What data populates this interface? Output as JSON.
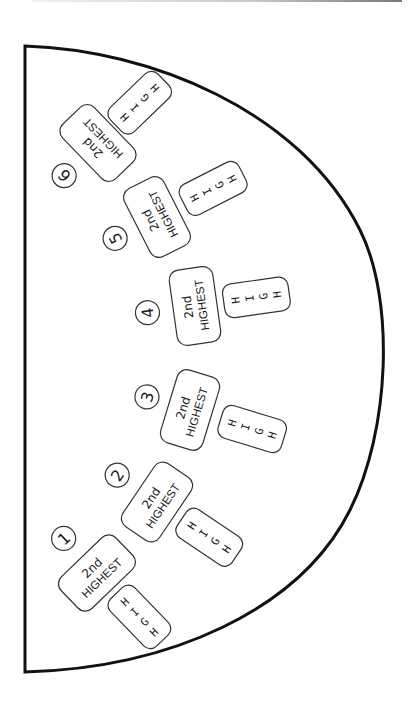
{
  "diagram": {
    "type": "card-table-layout",
    "colors": {
      "outline": "#111111",
      "box_stroke": "#333333",
      "text": "#1a1a1a",
      "background": "#ffffff"
    },
    "seats": [
      {
        "number": "1",
        "line1": "2nd",
        "line2": "HIGHEST",
        "high": [
          "H",
          "I",
          "G",
          "H"
        ]
      },
      {
        "number": "2",
        "line1": "2nd",
        "line2": "HIGHEST",
        "high": [
          "H",
          "I",
          "G",
          "H"
        ]
      },
      {
        "number": "3",
        "line1": "2nd",
        "line2": "HIGHEST",
        "high": [
          "H",
          "I",
          "G",
          "H"
        ]
      },
      {
        "number": "4",
        "line1": "2nd",
        "line2": "HIGHEST",
        "high": [
          "H",
          "I",
          "G",
          "H"
        ]
      },
      {
        "number": "5",
        "line1": "2nd",
        "line2": "HIGHEST",
        "high": [
          "H",
          "I",
          "G",
          "H"
        ]
      },
      {
        "number": "6",
        "line1": "2nd",
        "line2": "HIGHEST",
        "high": [
          "H",
          "I",
          "G",
          "H"
        ]
      }
    ]
  }
}
